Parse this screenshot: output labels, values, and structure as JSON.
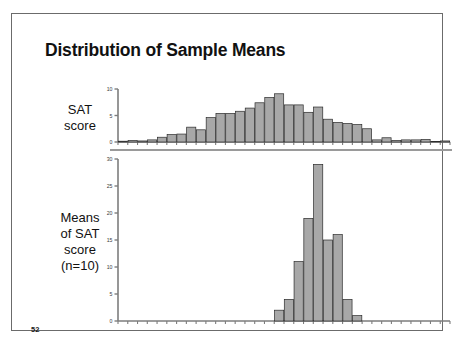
{
  "slide": {
    "title": "Distribution of Sample Means",
    "page_number": "52",
    "border_color": "#6b6b6b",
    "background": "#ffffff"
  },
  "labels": {
    "top_row": "SAT\nscore",
    "top_row_line1": "SAT",
    "top_row_line2": "score",
    "bottom_row_line1": "Means",
    "bottom_row_line2": "of SAT",
    "bottom_row_line3": "score",
    "bottom_row_line4": "(n=10)"
  },
  "colors": {
    "bar_fill": "#a8a8a8",
    "bar_stroke": "#2b2b2b",
    "axis": "#7d7d7d",
    "tick_label": "#3a3a3a",
    "title": "#111111"
  },
  "chart_data": [
    {
      "type": "bar",
      "id": "sat-score-histogram",
      "title": "SAT score",
      "xlabel": "",
      "ylabel": "",
      "ylim": [
        0,
        10
      ],
      "yticks": [
        0,
        5,
        10
      ],
      "ytick_labels": [
        "0",
        "5",
        "10"
      ],
      "grid": false,
      "legend": false,
      "xticks_count": 34,
      "categories": [
        "1",
        "2",
        "3",
        "4",
        "5",
        "6",
        "7",
        "8",
        "9",
        "10",
        "11",
        "12",
        "13",
        "14",
        "15",
        "16",
        "17",
        "18",
        "19",
        "20",
        "21",
        "22",
        "23",
        "24",
        "25",
        "26",
        "27",
        "28",
        "29",
        "30",
        "31",
        "32",
        "33",
        "34"
      ],
      "values": [
        0.15,
        0.3,
        0.2,
        0.4,
        0.9,
        1.4,
        1.5,
        2.8,
        2.3,
        4.6,
        5.4,
        5.4,
        5.8,
        6.4,
        7.4,
        8.4,
        9.1,
        7.0,
        7.0,
        5.6,
        6.6,
        4.3,
        3.7,
        3.5,
        3.3,
        2.5,
        0.4,
        0.8,
        0.3,
        0.4,
        0.4,
        0.5,
        0.05,
        0.2
      ]
    },
    {
      "type": "bar",
      "id": "means-of-sat-score-histogram",
      "title": "Means of SAT score (n=10)",
      "xlabel": "",
      "ylabel": "",
      "ylim": [
        0,
        30
      ],
      "yticks": [
        0,
        5,
        10,
        15,
        20,
        25,
        30
      ],
      "ytick_labels": [
        "0",
        "5",
        "10",
        "15",
        "20",
        "25",
        "30"
      ],
      "grid": false,
      "legend": false,
      "xticks_count": 34,
      "bar_start_index": 16,
      "categories": [
        "17",
        "18",
        "19",
        "20",
        "21",
        "22",
        "23",
        "24",
        "25"
      ],
      "values": [
        2,
        4,
        11,
        19,
        29,
        15,
        16,
        4,
        1
      ]
    }
  ]
}
